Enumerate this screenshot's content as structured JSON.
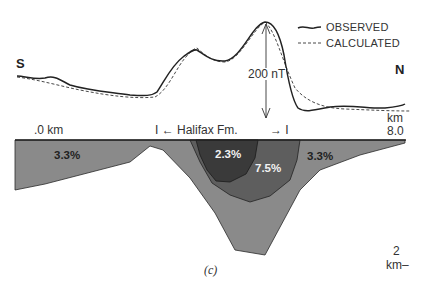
{
  "figure": {
    "caption": "(c)",
    "directions": {
      "south": "S",
      "north": "N"
    },
    "legend": {
      "items": [
        {
          "label": "OBSERVED",
          "style": "solid"
        },
        {
          "label": "CALCULATED",
          "style": "dashed"
        }
      ]
    },
    "scale_bar": {
      "label": "200 nT"
    },
    "distance_axis": {
      "start_label": ".0 km",
      "end_unit": "km",
      "end_value": "8.0"
    },
    "formation": {
      "label": "I ← Halifax Fm.",
      "end_marker": "→ I"
    },
    "depth_scale": {
      "value": "2",
      "unit": "km–"
    },
    "units": [
      {
        "name": "outer",
        "label": "3.3%",
        "color": "#8a8a8a"
      },
      {
        "name": "outer-right",
        "label": "3.3%",
        "color": "#8a8a8a"
      },
      {
        "name": "middle",
        "label": "7.5%",
        "color": "#5e5e5e"
      },
      {
        "name": "core",
        "label": "2.3%",
        "color": "#3a3a3a"
      }
    ],
    "colors": {
      "line": "#222222",
      "baseline": "#222222"
    }
  }
}
